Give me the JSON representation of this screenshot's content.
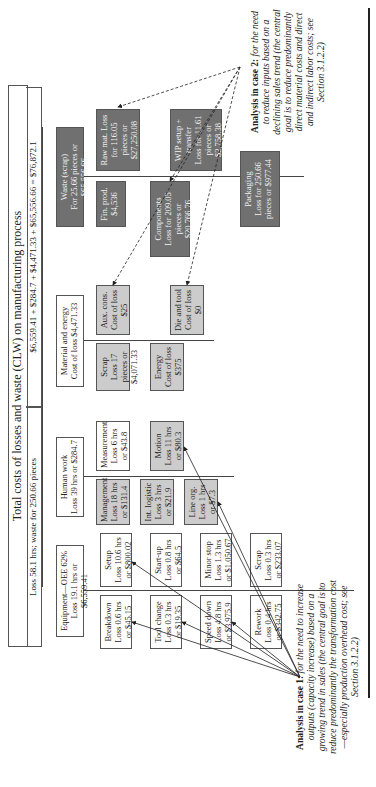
{
  "title": "Total costs of losses and waste (CLW) on manufacturing process",
  "summary_left": "Loss 58.1 hrs; waste for 250.66 pieces",
  "summary_right": "$6,559.41 + $284.7 + $4,471.33 + $65,556.66 = $76,872.1",
  "categories": [
    {
      "label": "Equipment—OEE 62%",
      "sub": "Loss 19.1 hrs or $6,559.41"
    },
    {
      "label": "Human work",
      "sub": "Loss 39 hrs or $284.7"
    },
    {
      "label": "Material and energy",
      "sub": "Cost of loss $4,471.33"
    },
    {
      "label": "Waste (scrap)",
      "sub": "For 25.66 pieces or $65,556.66"
    }
  ],
  "equipment_items": [
    {
      "name": "Breakdown",
      "value": "Loss 0.6 hrs or $45.15"
    },
    {
      "name": "Setup",
      "value": "Loss 10.6 hrs or $800.02"
    },
    {
      "name": "Tool change",
      "value": "Loss 0.3 hrs or $19.35"
    },
    {
      "name": "Start-up",
      "value": "Loss 0.8 hrs or $64.5"
    },
    {
      "name": "Speed down",
      "value": "Loss 4.8 hrs or $3,975.9"
    },
    {
      "name": "Minor stop",
      "value": "Loss 1.3 hrs or $1,050.67"
    },
    {
      "name": "Rework",
      "value": "Loss 0.4 hrs or $342.75"
    },
    {
      "name": "Scrap",
      "value": "Loss 0.3 hrs or $233.07"
    }
  ],
  "human_items": [
    {
      "name": "Management",
      "value": "Loss 18 hrs or $131.4"
    },
    {
      "name": "Int. logistic",
      "value": "Loss 3 hrs or $21.9"
    },
    {
      "name": "Line org.",
      "value": "Loss 1 hrs or $7.3"
    },
    {
      "name": "Measurement",
      "value": "Loss 6 hrs or $43.8"
    },
    {
      "name": "Motion",
      "value": "Loss 11 hrs or $80.3"
    }
  ],
  "material_items": [
    {
      "name": "Scrap",
      "value": "Loss 17 pieces or $4,071.33"
    },
    {
      "name": "Energy",
      "value": "Cost of loss $375"
    },
    {
      "name": "Aux. cons.",
      "value": "Cost of loss $25"
    },
    {
      "name": "Die and tool",
      "value": "Cost of loss $0"
    }
  ],
  "waste_items": [
    {
      "name": "Fin. prod.",
      "value": "$4,536"
    },
    {
      "name": "Raw mat. Loss",
      "value": "for 116.05 pieces or $27,250.08"
    },
    {
      "name": "Components",
      "value": "Loss for 209.05 pieces or $20,766.76"
    },
    {
      "name": "WIP setup + transfer",
      "value": "Loss for 11.61 pieces or $2,758.38"
    },
    {
      "name": "Packaging",
      "value": "Loss for 250.66 pieces or $977.44"
    }
  ],
  "note_case1": {
    "bold": "Analysis in case 1:",
    "text": " for the need to increase outputs (capacity increase) based on a growing trend in sales (the central goal is to reduce predominantly the transformation cost—especially production overhead cost; see Section 3.1.2.2)"
  },
  "note_case2": {
    "bold": "Analysis in case 2:",
    "text": " for the need to reduce inputs based on a declining sales trend (the central goal is to reduce predominantly direct material costs and direct and indirect labor costs; see Section 3.1.2.2)"
  }
}
